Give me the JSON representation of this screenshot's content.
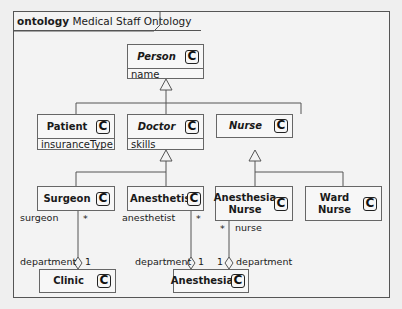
{
  "frame": {
    "keyword": "ontology",
    "title": "Medical Staff Ontology"
  },
  "classes": {
    "person": {
      "name": "Person",
      "abstract": true,
      "attribute": "name",
      "icon": "class-icon",
      "icon_glyph": "C"
    },
    "patient": {
      "name": "Patient",
      "abstract": false,
      "attribute": "insuranceType",
      "icon": "class-icon",
      "icon_glyph": "C"
    },
    "doctor": {
      "name": "Doctor",
      "abstract": true,
      "attribute": "skills",
      "icon": "class-icon",
      "icon_glyph": "C"
    },
    "nurse": {
      "name": "Nurse",
      "abstract": true,
      "icon": "class-icon",
      "icon_glyph": "C"
    },
    "surgeon": {
      "name": "Surgeon",
      "abstract": false,
      "icon": "class-icon",
      "icon_glyph": "C"
    },
    "anesthetist": {
      "name": "Anesthetist",
      "abstract": false,
      "icon": "class-icon",
      "icon_glyph": "C"
    },
    "anesthesia_nurse": {
      "name_line1": "Anesthesia",
      "name_line2": "Nurse",
      "abstract": false,
      "icon": "class-icon",
      "icon_glyph": "C"
    },
    "ward_nurse": {
      "name_line1": "Ward",
      "name_line2": "Nurse",
      "abstract": false,
      "icon": "class-icon",
      "icon_glyph": "C"
    },
    "clinic": {
      "name": "Clinic",
      "abstract": false,
      "icon": "class-icon",
      "icon_glyph": "C"
    },
    "anesthesia": {
      "name": "Anesthesia",
      "abstract": false,
      "icon": "class-icon",
      "icon_glyph": "C"
    }
  },
  "associations": [
    {
      "from": "Surgeon",
      "to": "Clinic",
      "from_role": "surgeon",
      "from_mult": "*",
      "to_role": "department",
      "to_mult": "1",
      "kind": "aggregation"
    },
    {
      "from": "Anesthetist",
      "to": "Anesthesia",
      "from_role": "anesthetist",
      "from_mult": "*",
      "to_role": "department",
      "to_mult": "1",
      "kind": "aggregation"
    },
    {
      "from": "Anesthesia Nurse",
      "to": "Anesthesia",
      "from_role": "nurse",
      "from_mult": "*",
      "to_role": "department",
      "to_mult": "1",
      "kind": "aggregation"
    }
  ],
  "generalizations": [
    {
      "parent": "Person",
      "children": [
        "Patient",
        "Doctor",
        "Nurse"
      ]
    },
    {
      "parent": "Doctor",
      "children": [
        "Surgeon",
        "Anesthetist"
      ]
    },
    {
      "parent": "Nurse",
      "children": [
        "Anesthesia Nurse",
        "Ward Nurse"
      ]
    }
  ]
}
